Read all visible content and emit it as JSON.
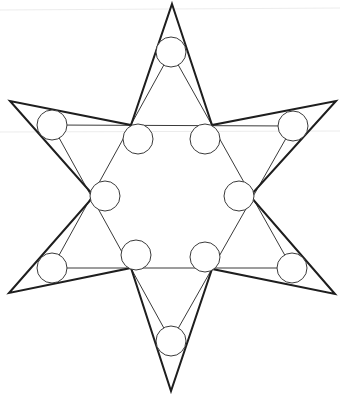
{
  "diagram": {
    "type": "hexagram-circle-puzzle",
    "colors": {
      "background": "#ffffff",
      "outline": "#1e1e1e",
      "inner_lines": "#3a3a3a",
      "circle_stroke": "#3a3a3a",
      "circle_fill": "#ffffff"
    },
    "outer_star": {
      "points": [
        [
          172,
          4
        ],
        [
          212,
          125
        ],
        [
          336,
          101
        ],
        [
          250,
          196
        ],
        [
          335,
          294
        ],
        [
          212,
          269
        ],
        [
          171,
          391
        ],
        [
          131,
          268
        ],
        [
          9,
          293
        ],
        [
          94,
          196
        ],
        [
          10,
          101
        ],
        [
          131,
          125
        ]
      ],
      "stroke_width": 2
    },
    "inner_lines": [
      {
        "name": "triangle-up",
        "points": [
          [
            171,
            52
          ],
          [
            52,
            268
          ],
          [
            292,
            268
          ]
        ]
      },
      {
        "name": "triangle-down",
        "points": [
          [
            52,
            125
          ],
          [
            293,
            126
          ],
          [
            171,
            341
          ]
        ]
      }
    ],
    "circles": [
      {
        "id": "top",
        "cx": 171,
        "cy": 52,
        "r": 15
      },
      {
        "id": "upper-left-tip",
        "cx": 52,
        "cy": 125,
        "r": 15
      },
      {
        "id": "upper-right-tip",
        "cx": 293,
        "cy": 126,
        "r": 15
      },
      {
        "id": "inner-upper-left",
        "cx": 138,
        "cy": 139,
        "r": 15
      },
      {
        "id": "inner-upper-right",
        "cx": 205,
        "cy": 139,
        "r": 15
      },
      {
        "id": "middle-left",
        "cx": 105,
        "cy": 196,
        "r": 15
      },
      {
        "id": "middle-right",
        "cx": 239,
        "cy": 196,
        "r": 15
      },
      {
        "id": "lower-left-tip",
        "cx": 52,
        "cy": 268,
        "r": 15
      },
      {
        "id": "lower-right-tip",
        "cx": 292,
        "cy": 268,
        "r": 15
      },
      {
        "id": "inner-lower-left",
        "cx": 136,
        "cy": 255,
        "r": 15
      },
      {
        "id": "inner-lower-right",
        "cx": 205,
        "cy": 257,
        "r": 15
      },
      {
        "id": "bottom",
        "cx": 171,
        "cy": 341,
        "r": 15
      }
    ]
  }
}
